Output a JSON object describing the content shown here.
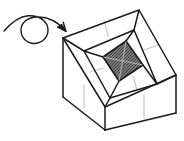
{
  "figure": {
    "background_color": "#ffffff",
    "stroke_color": "#1a1a1a",
    "crease_color": "#c9c9c9",
    "inner_bottom_fill": "#767676",
    "inner_bottom_hatch": "#3a3a3a",
    "wall_fill": "#ffffff"
  },
  "arrow": {
    "name": "rotation-arrow",
    "stroke_color": "#1a1a1a",
    "stroke_width": 1.4,
    "tail_path": "M 4,31 C 12,22 20,16 29,16 C 42,16 49,25 49,31 C 49,38 42,44 34,44 C 26,44 21,38 21,31 C 21,24 27,18 36,17 C 47,16 57,21 65,30",
    "head_points": "65,30 58,26.5 61.5,23.5",
    "head_points_b": "65,30 63.5,22.5 60.2,25.8"
  },
  "box": {
    "name": "open-box",
    "outer_rim": {
      "top_corner": [
        139,
        10
      ],
      "left_corner": [
        63,
        38
      ],
      "right_corner": [
        176,
        75
      ],
      "front_corner": [
        105,
        107
      ]
    },
    "inner_rim": {
      "top_corner": [
        134,
        30
      ],
      "left_corner": [
        84,
        51
      ],
      "right_corner": [
        157,
        84
      ],
      "front_corner": [
        110,
        98
      ]
    },
    "inner_bottom": {
      "top_corner": [
        126,
        41
      ],
      "left_corner": [
        103,
        57
      ],
      "right_corner": [
        143,
        65
      ],
      "front_corner": [
        119,
        81
      ]
    },
    "front_faces": {
      "left_bottom": [
        105,
        130
      ],
      "left_outer_bottom": [
        63,
        97
      ],
      "right_outer_bottom": [
        176,
        113
      ]
    },
    "creases": [
      {
        "name": "back-left-inner-crease",
        "x1": 104,
        "y1": 20,
        "x2": 108,
        "y2": 36
      },
      {
        "name": "back-right-inner-crease",
        "x1": 158,
        "y1": 45,
        "x2": 144,
        "y2": 50
      },
      {
        "name": "front-right-inner-crease",
        "x1": 137,
        "y1": 90,
        "x2": 133,
        "y2": 76
      },
      {
        "name": "front-left-inner-crease",
        "x1": 90,
        "y1": 72,
        "x2": 104,
        "y2": 68
      },
      {
        "name": "front-left-face-crease",
        "x1": 84,
        "y1": 85,
        "x2": 84,
        "y2": 108
      },
      {
        "name": "front-right-face-crease",
        "x1": 144,
        "y1": 95,
        "x2": 144,
        "y2": 118
      }
    ]
  },
  "inner_bottom_lines": {
    "name": "bottom-fold-lines",
    "diagonals": [
      {
        "x1": 103,
        "y1": 57,
        "x2": 143,
        "y2": 65
      },
      {
        "x1": 126,
        "y1": 41,
        "x2": 119,
        "y2": 81
      }
    ]
  }
}
